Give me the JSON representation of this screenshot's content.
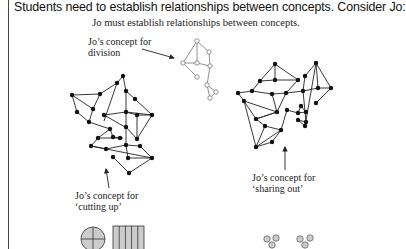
{
  "heading": "Students need to establish relationships between concepts. Consider Jo:",
  "diagram": {
    "title": "Jo must establish relationships between concepts.",
    "labels": {
      "division": [
        "Jo’s concept for",
        "division"
      ],
      "cutting_up": [
        "Jo’s concept for",
        "‘cutting up’"
      ],
      "sharing_out": [
        "Jo’s concept for",
        "‘sharing out’"
      ]
    },
    "icons": [
      "circle-quartered-icon",
      "rectangle-fifths-icon",
      "grouped-dots-icon"
    ]
  }
}
